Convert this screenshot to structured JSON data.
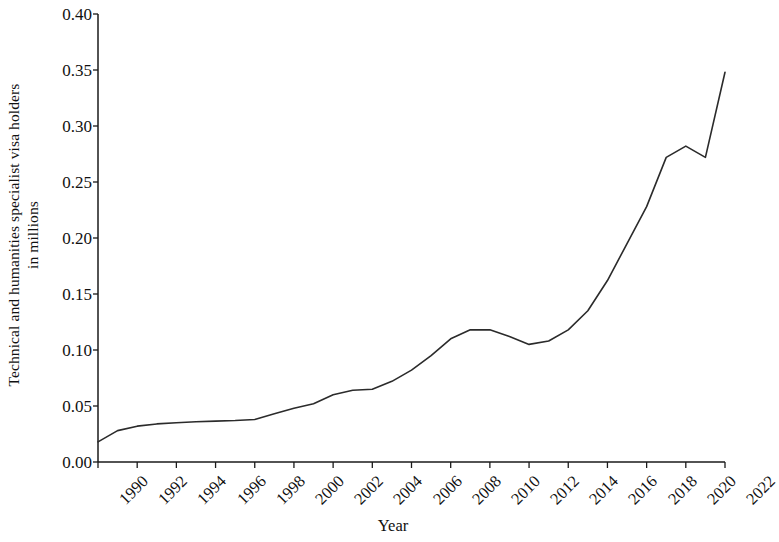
{
  "chart_data": {
    "type": "line",
    "title": "",
    "xlabel": "Year",
    "ylabel_line1": "Technical and humanities specialist visa holders",
    "ylabel_line2": "in millions",
    "ylabel": "Technical and humanities specialist visa holders in millions",
    "xlim": [
      1990,
      2022
    ],
    "ylim": [
      0.0,
      0.4
    ],
    "grid": false,
    "legend": null,
    "line_color": "#2b2b2b",
    "yticks": [
      "0.00",
      "0.05",
      "0.10",
      "0.15",
      "0.20",
      "0.25",
      "0.30",
      "0.35",
      "0.40"
    ],
    "ytick_values": [
      0.0,
      0.05,
      0.1,
      0.15,
      0.2,
      0.25,
      0.3,
      0.35,
      0.4
    ],
    "xticks": [
      "1990",
      "1992",
      "1994",
      "1996",
      "1998",
      "2000",
      "2002",
      "2004",
      "2006",
      "2008",
      "2010",
      "2012",
      "2014",
      "2016",
      "2018",
      "2020",
      "2022"
    ],
    "xtick_values": [
      1990,
      1992,
      1994,
      1996,
      1998,
      2000,
      2002,
      2004,
      2006,
      2008,
      2010,
      2012,
      2014,
      2016,
      2018,
      2020,
      2022
    ],
    "x": [
      1990,
      1991,
      1992,
      1993,
      1994,
      1995,
      1996,
      1997,
      1998,
      1999,
      2000,
      2001,
      2002,
      2003,
      2004,
      2005,
      2006,
      2007,
      2008,
      2009,
      2010,
      2011,
      2012,
      2013,
      2014,
      2015,
      2016,
      2017,
      2018,
      2019,
      2020,
      2021,
      2022
    ],
    "values": [
      0.018,
      0.026,
      0.031,
      0.033,
      0.035,
      0.036,
      0.036,
      0.037,
      0.038,
      0.042,
      0.047,
      0.05,
      0.058,
      0.064,
      0.065,
      0.068,
      0.078,
      0.087,
      0.095,
      0.108,
      0.118,
      0.118,
      0.113,
      0.11,
      0.108,
      0.112,
      0.118,
      0.132,
      0.158,
      0.19,
      0.225,
      0.248,
      0.272
    ],
    "series": [
      {
        "name": "Technical and humanities specialist visa holders",
        "x": [
          1990,
          1991,
          1992,
          1993,
          1994,
          1995,
          1996,
          1997,
          1998,
          1999,
          2000,
          2001,
          2002,
          2003,
          2004,
          2005,
          2006,
          2007,
          2008,
          2009,
          2010,
          2011,
          2012,
          2013,
          2014,
          2015,
          2016,
          2017,
          2018,
          2019,
          2020,
          2021,
          2022
        ],
        "values": [
          0.018,
          0.028,
          0.032,
          0.034,
          0.035,
          0.036,
          0.0365,
          0.037,
          0.038,
          0.043,
          0.048,
          0.052,
          0.06,
          0.064,
          0.065,
          0.072,
          0.082,
          0.095,
          0.11,
          0.118,
          0.118,
          0.112,
          0.105,
          0.108,
          0.118,
          0.135,
          0.162,
          0.195,
          0.228,
          0.272,
          0.282,
          0.272,
          0.348
        ]
      }
    ]
  },
  "axis": {
    "x_title": "Year"
  }
}
